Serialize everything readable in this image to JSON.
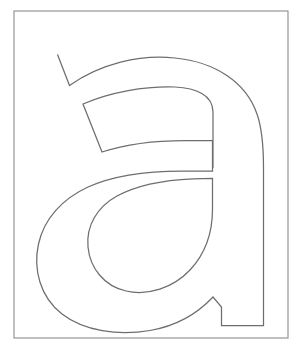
{
  "page": {
    "background_color": "#ffffff",
    "width": 300,
    "height": 352
  },
  "frame": {
    "name": "border-frame",
    "x": 14,
    "y": 11,
    "width": 274,
    "height": 327,
    "stroke_color": "#8c8c8c",
    "stroke_width": 1.1,
    "fill_color": "#ffffff"
  },
  "glyph": {
    "character": "a",
    "case": "lowercase",
    "style": "outline",
    "description": "Lowercase letter a rendered as a hollow outline for coloring",
    "stroke_color": "#6e6e6e",
    "stroke_width": 1.25,
    "fill_color": "#ffffff",
    "outer_path": "M 57.5 54.5 L 69.5 85.5 C 100 64 140 54 175 58 C 215 62 246 82 257 114 C 263 131 263.5 150 263.5 168 L 263.5 325.5 L 221.5 325.5 L 221.5 307.0 L 213.0 297.0 C 198 313 176 326 150 330.5 C 118 336 84 331 62 314 C 40 297 33 269 38.5 244 C 44 219 62 199 88 187 C 114 175 148 171 182 171 L 212.5 171 L 212.5 140.5 L 185 140.5 C 155 140.5 126 144 102 152 L 83 104 C 111 92 145 86 175 87 C 196 88 213 95 213 112 L 213 168",
    "counter_path": "M 212.5 178.5 L 212.5 209 C 212.5 232 205 254 190 270 C 173 288 148 296 126 291 C 104 286 90 268 88 247 C 86 226 97 207 117 196 C 137 185 165 180 193 178.8 Z",
    "anchor_points": {
      "top_terminal_outer": [
        57.5,
        54.5
      ],
      "top_terminal_inner": [
        69.5,
        85.5
      ],
      "stem_right_edge_x": 263.5,
      "stem_foot_left_x": 221.5,
      "stem_foot_bottom_y": 325.5,
      "spur_peak": [
        213.0,
        297.0
      ],
      "bowl_leftmost_x": 38.5,
      "bowl_bottom_y": 330.5,
      "counter_leftmost_x": 87.0,
      "counter_bottom_y": 294.0,
      "counter_right_edge_x": 212.5,
      "shoulder_corner_upper": [
        212.5,
        140.5
      ],
      "shoulder_corner_lower": [
        212.5,
        178.5
      ]
    }
  }
}
